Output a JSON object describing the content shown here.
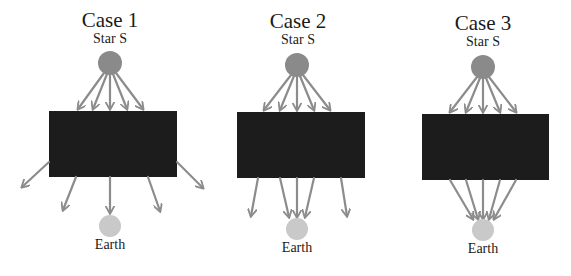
{
  "colors": {
    "star": "#8a8a8a",
    "earth": "#c9c9c9",
    "blocker": "#1c1c1c",
    "arrow": "#8c8c8c",
    "text": "#1a1a1a"
  },
  "cases": [
    {
      "title": "Case 1",
      "source_label": "Star S",
      "target_label": "Earth",
      "description": "light rays diverge after passing the dark block; only the central ray reaches Earth",
      "star": {
        "cx": 110,
        "cy": 63,
        "r": 12
      },
      "block": {
        "x": 49,
        "y": 111,
        "w": 128,
        "h": 66
      },
      "earth": {
        "cx": 110,
        "cy": 226,
        "r": 11
      },
      "title_pos": {
        "x": 110,
        "y": 20
      },
      "star_label_pos": {
        "x": 110,
        "y": 38
      },
      "earth_label_pos": {
        "x": 110,
        "y": 243
      },
      "arrows_in": [
        [
          104,
          73,
          78,
          109
        ],
        [
          107,
          74,
          93,
          109
        ],
        [
          110,
          75,
          110,
          109
        ],
        [
          113,
          74,
          127,
          109
        ],
        [
          116,
          73,
          143,
          109
        ]
      ],
      "arrows_out": [
        [
          49,
          162,
          22,
          187
        ],
        [
          76,
          177,
          63,
          210
        ],
        [
          110,
          177,
          110,
          213
        ],
        [
          148,
          177,
          160,
          211
        ],
        [
          177,
          162,
          203,
          188
        ]
      ]
    },
    {
      "title": "Case 2",
      "source_label": "Star S",
      "target_label": "Earth",
      "description": "central rays are focused onto Earth while outer rays pass by",
      "star": {
        "cx": 297,
        "cy": 65,
        "r": 12
      },
      "block": {
        "x": 237,
        "y": 112,
        "w": 128,
        "h": 66
      },
      "earth": {
        "cx": 297,
        "cy": 229,
        "r": 11
      },
      "title_pos": {
        "x": 298,
        "y": 20
      },
      "star_label_pos": {
        "x": 298,
        "y": 39
      },
      "earth_label_pos": {
        "x": 297,
        "y": 246
      },
      "arrows_in": [
        [
          291,
          75,
          264,
          110
        ],
        [
          294,
          76,
          280,
          110
        ],
        [
          297,
          77,
          297,
          110
        ],
        [
          300,
          76,
          314,
          110
        ],
        [
          303,
          75,
          330,
          110
        ]
      ],
      "arrows_out": [
        [
          258,
          178,
          251,
          216
        ],
        [
          280,
          178,
          289,
          217
        ],
        [
          297,
          178,
          297,
          217
        ],
        [
          314,
          178,
          305,
          217
        ],
        [
          341,
          178,
          347,
          216
        ]
      ]
    },
    {
      "title": "Case 3",
      "source_label": "Star S",
      "target_label": "Earth",
      "description": "all rays are focused onto Earth",
      "star": {
        "cx": 483,
        "cy": 67,
        "r": 12
      },
      "block": {
        "x": 422,
        "y": 114,
        "w": 127,
        "h": 66
      },
      "earth": {
        "cx": 483,
        "cy": 230,
        "r": 11
      },
      "title_pos": {
        "x": 483,
        "y": 22
      },
      "star_label_pos": {
        "x": 483,
        "y": 40
      },
      "earth_label_pos": {
        "x": 483,
        "y": 247
      },
      "arrows_in": [
        [
          477,
          77,
          450,
          112
        ],
        [
          480,
          78,
          466,
          112
        ],
        [
          483,
          79,
          483,
          112
        ],
        [
          486,
          78,
          500,
          112
        ],
        [
          489,
          77,
          516,
          112
        ]
      ],
      "arrows_out": [
        [
          450,
          180,
          473,
          219
        ],
        [
          466,
          180,
          478,
          219
        ],
        [
          483,
          180,
          483,
          219
        ],
        [
          500,
          180,
          489,
          219
        ],
        [
          516,
          180,
          494,
          219
        ]
      ]
    }
  ]
}
